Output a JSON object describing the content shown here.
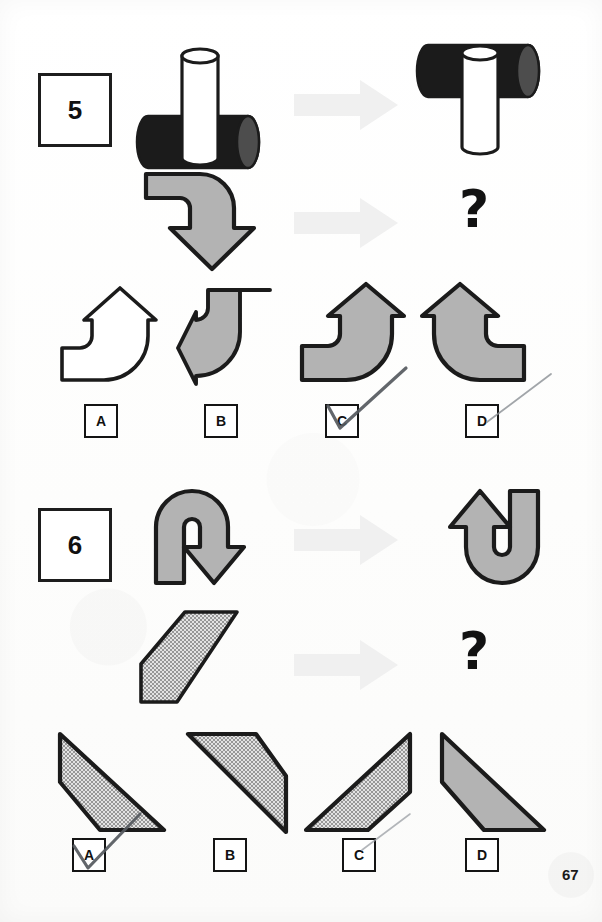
{
  "page": {
    "page_number": "67",
    "background_color": "#fefefe",
    "ink_color": "#1a1a1a",
    "gray_fill": "#b3b3b3",
    "arrow_hint_color": "#f0f0f0",
    "pen_mark_color": "#55595e"
  },
  "questions": [
    {
      "number": "5",
      "example": {
        "source_shape_name": "white-vertical-cylinder-through-black-horizontal-cylinder",
        "transition_icon": "right-arrow-icon",
        "result_shape_name": "black-horizontal-cylinder-on-top-of-white-vertical-cylinder",
        "transformation": "rotate-180-vertical-flip"
      },
      "prompt": {
        "source_shape_name": "gray-bent-arrow-right-then-down",
        "transition_icon": "right-arrow-icon",
        "result_placeholder": "?"
      },
      "options": [
        {
          "letter": "A",
          "shape_name": "white-bent-arrow-left-then-up",
          "fill": "white",
          "checked": false
        },
        {
          "letter": "B",
          "shape_name": "gray-bent-arrow-down-then-left",
          "fill": "gray",
          "checked": false
        },
        {
          "letter": "C",
          "shape_name": "gray-bent-arrow-left-then-up",
          "fill": "gray",
          "checked": true
        },
        {
          "letter": "D",
          "shape_name": "gray-bent-arrow-right-then-up",
          "fill": "gray",
          "checked": false
        }
      ],
      "selected_answer": "C"
    },
    {
      "number": "6",
      "example": {
        "source_shape_name": "gray-u-turn-arrow-pointing-down-right",
        "transition_icon": "right-arrow-icon",
        "result_shape_name": "gray-u-turn-arrow-pointing-up-right",
        "transformation": "rotate-180"
      },
      "prompt": {
        "source_shape_name": "textured-parallelogram-leaning-right",
        "transition_icon": "right-arrow-icon",
        "result_placeholder": "?"
      },
      "options": [
        {
          "letter": "A",
          "shape_name": "textured-trapezoid-descending-right",
          "fill": "textured",
          "checked": true
        },
        {
          "letter": "B",
          "shape_name": "textured-parallelogram-descending-right",
          "fill": "textured",
          "checked": false
        },
        {
          "letter": "C",
          "shape_name": "textured-trapezoid-ascending-right",
          "fill": "textured",
          "checked": false
        },
        {
          "letter": "D",
          "shape_name": "gray-triangle-descending-right",
          "fill": "gray",
          "checked": false
        }
      ],
      "selected_answer": "A"
    }
  ]
}
